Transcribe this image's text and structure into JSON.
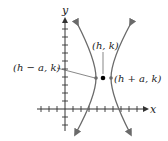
{
  "diagram": {
    "type": "horizontal-hyperbola",
    "axes": {
      "x_label": "x",
      "y_label": "y",
      "origin_px": [
        65,
        109
      ],
      "tick_spacing_px": 8
    },
    "points": {
      "center": {
        "label": "(h, k)",
        "px": [
          103,
          78
        ]
      },
      "left_vertex": {
        "label": "(h − a, k)",
        "px": [
          96,
          78
        ]
      },
      "right_vertex": {
        "label": "(h + a, k)",
        "px": [
          111,
          78
        ]
      }
    },
    "colors": {
      "axis": "#333333",
      "curve": "#6a6a6a",
      "point": "#000000",
      "background": "#ffffff"
    }
  }
}
